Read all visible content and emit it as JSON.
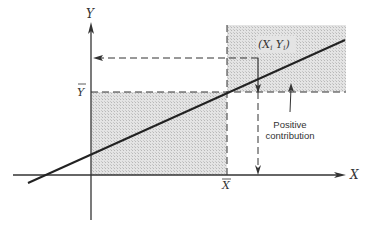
{
  "diagram": {
    "axes": {
      "x_label": "X",
      "y_label": "Y",
      "x_mean_label": "X",
      "y_mean_label": "Y"
    },
    "point_label": "(X",
    "point_label_sub_i": "i",
    "point_label_mid": " Y",
    "point_label_end": ")",
    "annotation": {
      "line1": "Positive",
      "line2": "contribution"
    },
    "colors": {
      "shade": "#dcdcdc",
      "line": "#222222",
      "dash": "#333333"
    }
  }
}
